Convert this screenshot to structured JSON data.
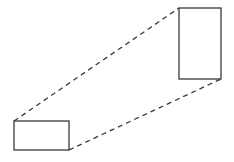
{
  "diagram": {
    "stroke_color": "#3a3a3a",
    "background": "#ffffff",
    "small_rect": {
      "x": 14,
      "y": 121,
      "width": 55,
      "height": 29
    },
    "large_rect": {
      "x": 179,
      "y": 8,
      "width": 42,
      "height": 71
    },
    "connectors": [
      {
        "from": "small_rect.top_left",
        "to": "large_rect.top_left",
        "style": "dashed"
      },
      {
        "from": "small_rect.bottom_right",
        "to": "large_rect.bottom_right",
        "style": "dashed"
      }
    ]
  }
}
